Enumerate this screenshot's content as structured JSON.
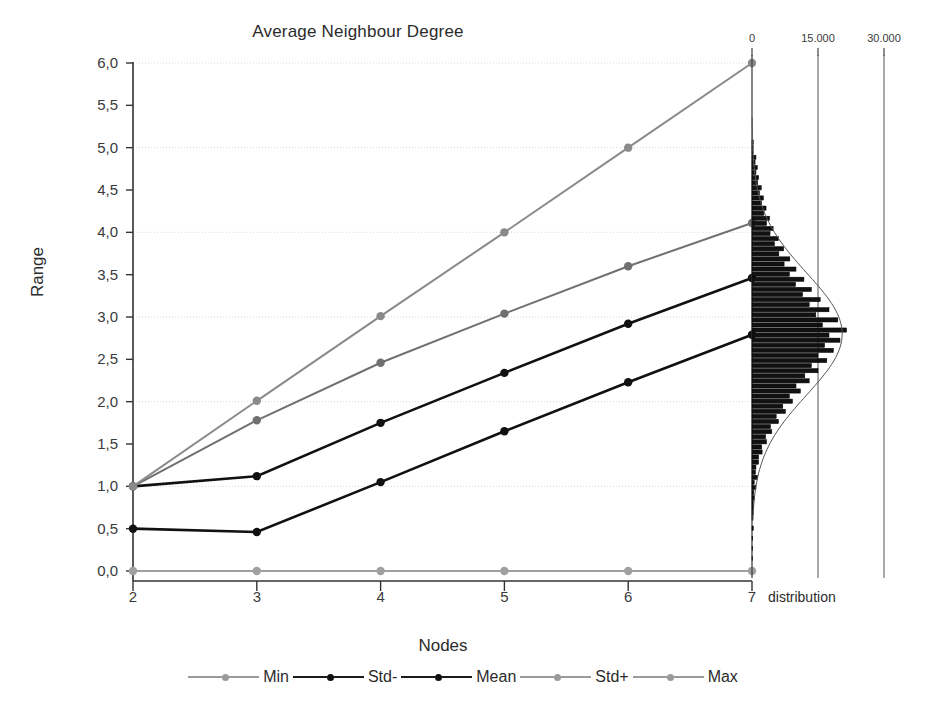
{
  "chart_data": {
    "type": "line",
    "title": "Average Neighbour Degree",
    "xlabel": "Nodes",
    "ylabel": "Range",
    "categories": [
      2,
      3,
      4,
      5,
      6,
      7
    ],
    "xtick_labels": [
      "2",
      "3",
      "4",
      "5",
      "6",
      "7"
    ],
    "xlim": [
      2,
      7
    ],
    "ylim": [
      0.0,
      6.0
    ],
    "ytick_labels": [
      "0,0",
      "0,5",
      "1,0",
      "1,5",
      "2,0",
      "2,5",
      "3,0",
      "3,5",
      "4,0",
      "4,5",
      "5,0",
      "5,5",
      "6,0"
    ],
    "ytick_values": [
      0.0,
      0.5,
      1.0,
      1.5,
      2.0,
      2.5,
      3.0,
      3.5,
      4.0,
      4.5,
      5.0,
      5.5,
      6.0
    ],
    "gridlines_at": [
      1.0,
      2.0,
      3.0,
      4.0,
      5.0,
      6.0
    ],
    "grid": true,
    "legend_position": "bottom",
    "series": [
      {
        "name": "Min",
        "color": "#a0a0a0",
        "values": [
          0.0,
          0.0,
          0.0,
          0.0,
          0.0,
          0.0
        ]
      },
      {
        "name": "Std-",
        "color": "#111111",
        "values": [
          0.5,
          0.46,
          1.05,
          1.65,
          2.23,
          2.79
        ]
      },
      {
        "name": "Mean",
        "color": "#111111",
        "values": [
          1.0,
          1.12,
          1.75,
          2.34,
          2.92,
          3.46
        ]
      },
      {
        "name": "Std+",
        "color": "#707070",
        "values": [
          1.0,
          1.78,
          2.46,
          3.04,
          3.6,
          4.11
        ]
      },
      {
        "name": "Max",
        "color": "#8a8a8a",
        "values": [
          1.0,
          2.01,
          3.01,
          4.0,
          5.0,
          6.0
        ]
      }
    ],
    "secondary_panel": {
      "type": "histogram",
      "orientation": "horizontal",
      "axis_label": "distribution",
      "xtick_labels": [
        "0",
        "15.000",
        "30.000"
      ],
      "xtick_values": [
        0,
        15000,
        30000
      ],
      "xlim": [
        0,
        34000
      ],
      "overlay_curve": "normal",
      "bin_range": [
        1.15,
        5.1
      ],
      "bins": [
        {
          "y": 5.06,
          "count": 300
        },
        {
          "y": 5.0,
          "count": 260
        },
        {
          "y": 4.94,
          "count": 240
        },
        {
          "y": 4.88,
          "count": 900
        },
        {
          "y": 4.82,
          "count": 700
        },
        {
          "y": 4.76,
          "count": 1200
        },
        {
          "y": 4.7,
          "count": 900
        },
        {
          "y": 4.64,
          "count": 1500
        },
        {
          "y": 4.58,
          "count": 1300
        },
        {
          "y": 4.52,
          "count": 2100
        },
        {
          "y": 4.46,
          "count": 1700
        },
        {
          "y": 4.4,
          "count": 2600
        },
        {
          "y": 4.34,
          "count": 2200
        },
        {
          "y": 4.28,
          "count": 3200
        },
        {
          "y": 4.22,
          "count": 2700
        },
        {
          "y": 4.16,
          "count": 4000
        },
        {
          "y": 4.1,
          "count": 3300
        },
        {
          "y": 4.04,
          "count": 4800
        },
        {
          "y": 3.98,
          "count": 4100
        },
        {
          "y": 3.92,
          "count": 6000
        },
        {
          "y": 3.86,
          "count": 5100
        },
        {
          "y": 3.8,
          "count": 7200
        },
        {
          "y": 3.74,
          "count": 6100
        },
        {
          "y": 3.68,
          "count": 8600
        },
        {
          "y": 3.62,
          "count": 7300
        },
        {
          "y": 3.56,
          "count": 10000
        },
        {
          "y": 3.5,
          "count": 8500
        },
        {
          "y": 3.44,
          "count": 11800
        },
        {
          "y": 3.38,
          "count": 9900
        },
        {
          "y": 3.32,
          "count": 13500
        },
        {
          "y": 3.26,
          "count": 11500
        },
        {
          "y": 3.2,
          "count": 15500
        },
        {
          "y": 3.14,
          "count": 13000
        },
        {
          "y": 3.08,
          "count": 17500
        },
        {
          "y": 3.02,
          "count": 14500
        },
        {
          "y": 2.96,
          "count": 19500
        },
        {
          "y": 2.9,
          "count": 16000
        },
        {
          "y": 2.84,
          "count": 21500
        },
        {
          "y": 2.78,
          "count": 17500
        },
        {
          "y": 2.72,
          "count": 20000
        },
        {
          "y": 2.66,
          "count": 16500
        },
        {
          "y": 2.6,
          "count": 18500
        },
        {
          "y": 2.54,
          "count": 15000
        },
        {
          "y": 2.48,
          "count": 17000
        },
        {
          "y": 2.42,
          "count": 13500
        },
        {
          "y": 2.36,
          "count": 15000
        },
        {
          "y": 2.3,
          "count": 12000
        },
        {
          "y": 2.24,
          "count": 13000
        },
        {
          "y": 2.18,
          "count": 10000
        },
        {
          "y": 2.12,
          "count": 11000
        },
        {
          "y": 2.06,
          "count": 8500
        },
        {
          "y": 2.0,
          "count": 9200
        },
        {
          "y": 1.94,
          "count": 7000
        },
        {
          "y": 1.88,
          "count": 7600
        },
        {
          "y": 1.82,
          "count": 5500
        },
        {
          "y": 1.76,
          "count": 6000
        },
        {
          "y": 1.7,
          "count": 4200
        },
        {
          "y": 1.64,
          "count": 4500
        },
        {
          "y": 1.58,
          "count": 3100
        },
        {
          "y": 1.52,
          "count": 3300
        },
        {
          "y": 1.46,
          "count": 2200
        },
        {
          "y": 1.4,
          "count": 2300
        },
        {
          "y": 1.34,
          "count": 1500
        },
        {
          "y": 1.28,
          "count": 1500
        },
        {
          "y": 1.22,
          "count": 900
        },
        {
          "y": 1.16,
          "count": 800
        },
        {
          "y": 1.1,
          "count": 1300
        },
        {
          "y": 1.04,
          "count": 500
        },
        {
          "y": 0.98,
          "count": 900
        },
        {
          "y": 0.92,
          "count": 400
        },
        {
          "y": 0.86,
          "count": 600
        },
        {
          "y": 0.8,
          "count": 300
        },
        {
          "y": 0.74,
          "count": 400
        },
        {
          "y": 0.68,
          "count": 250
        },
        {
          "y": 0.62,
          "count": 200
        },
        {
          "y": 0.5,
          "count": 300
        },
        {
          "y": 0.38,
          "count": 150
        },
        {
          "y": 0.26,
          "count": 120
        },
        {
          "y": 0.14,
          "count": 100
        }
      ],
      "curve_peak_y": 2.8,
      "curve_sigma": 0.72,
      "curve_peak_count": 20500
    }
  },
  "legend": {
    "items": [
      {
        "label": "Min",
        "tone": "light"
      },
      {
        "label": "Std-",
        "tone": "dark"
      },
      {
        "label": "Mean",
        "tone": "dark"
      },
      {
        "label": "Std+",
        "tone": "light"
      },
      {
        "label": "Max",
        "tone": "light"
      }
    ]
  }
}
